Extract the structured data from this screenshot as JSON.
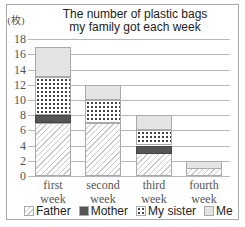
{
  "chart_data": {
    "type": "bar",
    "stacked": true,
    "title": "The number of plastic bags my family got each week",
    "title_lines": [
      "The number of plastic bags",
      "my family got each week"
    ],
    "ylabel": "(枚)",
    "xlabel": "",
    "ylim": [
      0,
      18
    ],
    "yticks": [
      0,
      2,
      4,
      6,
      8,
      10,
      12,
      14,
      16,
      18
    ],
    "grid": true,
    "legend_position": "bottom",
    "categories": [
      "first week",
      "second week",
      "third week",
      "fourth week"
    ],
    "category_lines": [
      [
        "first",
        "week"
      ],
      [
        "second",
        "week"
      ],
      [
        "third",
        "week"
      ],
      [
        "fourth",
        "week"
      ]
    ],
    "series": [
      {
        "name": "Father",
        "values": [
          7,
          7,
          3,
          1
        ]
      },
      {
        "name": "Mother",
        "values": [
          1,
          0,
          1,
          0
        ]
      },
      {
        "name": "My sister",
        "values": [
          5,
          3,
          2,
          0
        ]
      },
      {
        "name": "Me",
        "values": [
          4,
          2,
          2,
          1
        ]
      }
    ],
    "totals": [
      17,
      12,
      8,
      2
    ]
  },
  "legend": [
    {
      "label": "Father",
      "pattern": "diagonal-hatch"
    },
    {
      "label": "Mother",
      "pattern": "solid-dark"
    },
    {
      "label": "My sister",
      "pattern": "dotted"
    },
    {
      "label": "Me",
      "pattern": "light-gray"
    }
  ]
}
